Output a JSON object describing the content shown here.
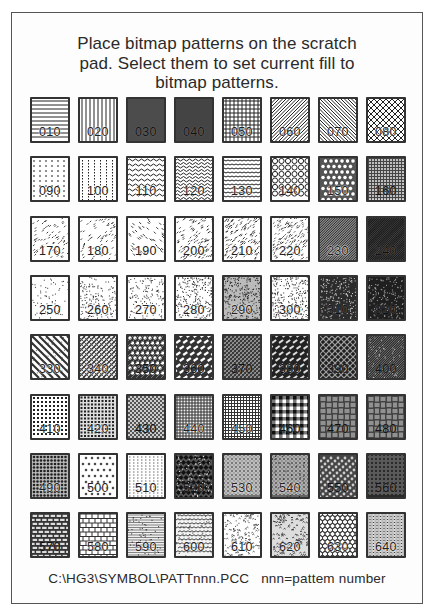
{
  "document": {
    "title_lines": [
      "Place bitmap patterns on the scratch",
      "pad.  Select them to set current fill to",
      "bitmap patterns."
    ],
    "caption": "C:\\HG3\\SYMBOL\\PATTnnn.PCC   nnn=pattem number"
  },
  "patterns": {
    "rows": [
      [
        {
          "label": "010",
          "pattern": "horizontal-lines"
        },
        {
          "label": "020",
          "pattern": "vertical-lines"
        },
        {
          "label": "030",
          "pattern": "dense-vertical-lines"
        },
        {
          "label": "040",
          "pattern": "dense-horizontal-lines"
        },
        {
          "label": "050",
          "pattern": "grid"
        },
        {
          "label": "060",
          "pattern": "diagonal-up"
        },
        {
          "label": "070",
          "pattern": "diagonal-down"
        },
        {
          "label": "080",
          "pattern": "diagonal-crosshatch"
        }
      ],
      [
        {
          "label": "090",
          "pattern": "dashes-sparse"
        },
        {
          "label": "100",
          "pattern": "dots-vertical"
        },
        {
          "label": "110",
          "pattern": "waves"
        },
        {
          "label": "120",
          "pattern": "dense-waves"
        },
        {
          "label": "130",
          "pattern": "scallops"
        },
        {
          "label": "140",
          "pattern": "circles"
        },
        {
          "label": "150",
          "pattern": "dense-circles"
        },
        {
          "label": "160",
          "pattern": "small-circles-dense"
        }
      ],
      [
        {
          "label": "170",
          "pattern": "scattered-dashes"
        },
        {
          "label": "180",
          "pattern": "scattered-dashes-2"
        },
        {
          "label": "190",
          "pattern": "diagonal-dashes-light"
        },
        {
          "label": "200",
          "pattern": "diagonal-dashes"
        },
        {
          "label": "210",
          "pattern": "diagonal-dashes-medium"
        },
        {
          "label": "220",
          "pattern": "diagonal-dashes-dense"
        },
        {
          "label": "230",
          "pattern": "diagonal-heavy"
        },
        {
          "label": "240",
          "pattern": "diagonal-heavier"
        }
      ],
      [
        {
          "label": "250",
          "pattern": "stipple-light"
        },
        {
          "label": "260",
          "pattern": "stipple-medium"
        },
        {
          "label": "270",
          "pattern": "stipple-medium-2"
        },
        {
          "label": "280",
          "pattern": "stipple-dense"
        },
        {
          "label": "290",
          "pattern": "stipple-denser"
        },
        {
          "label": "300",
          "pattern": "stipple-dense-2"
        },
        {
          "label": "310",
          "pattern": "stipple-dark"
        },
        {
          "label": "320",
          "pattern": "stipple-darker"
        }
      ],
      [
        {
          "label": "330",
          "pattern": "diagonal-bands"
        },
        {
          "label": "340",
          "pattern": "weave-light"
        },
        {
          "label": "350",
          "pattern": "lattice"
        },
        {
          "label": "360",
          "pattern": "diagonal-bricks"
        },
        {
          "label": "370",
          "pattern": "weave-dark"
        },
        {
          "label": "380",
          "pattern": "diagonal-bricks-dark"
        },
        {
          "label": "390",
          "pattern": "herringbone-dark"
        },
        {
          "label": "400",
          "pattern": "diagonal-dense-dark"
        }
      ],
      [
        {
          "label": "410",
          "pattern": "dot-grid"
        },
        {
          "label": "420",
          "pattern": "dot-grid-dense"
        },
        {
          "label": "430",
          "pattern": "checker-fine"
        },
        {
          "label": "440",
          "pattern": "square-grid-dots"
        },
        {
          "label": "450",
          "pattern": "fine-grid"
        },
        {
          "label": "460",
          "pattern": "plaid"
        },
        {
          "label": "470",
          "pattern": "basket-weave"
        },
        {
          "label": "480",
          "pattern": "basket-weave-2"
        }
      ],
      [
        {
          "label": "490",
          "pattern": "dot-grid-heavy"
        },
        {
          "label": "500",
          "pattern": "diamonds-sparse"
        },
        {
          "label": "510",
          "pattern": "dashes-fine"
        },
        {
          "label": "520",
          "pattern": "diamond-checker"
        },
        {
          "label": "530",
          "pattern": "circle-grid"
        },
        {
          "label": "540",
          "pattern": "circle-grid-2"
        },
        {
          "label": "550",
          "pattern": "diagonal-beads"
        },
        {
          "label": "560",
          "pattern": "circle-grid-dark"
        }
      ],
      [
        {
          "label": "570",
          "pattern": "bricks-dark"
        },
        {
          "label": "580",
          "pattern": "bricks"
        },
        {
          "label": "590",
          "pattern": "fine-horizontal"
        },
        {
          "label": "600",
          "pattern": "scales"
        },
        {
          "label": "610",
          "pattern": "random-marks"
        },
        {
          "label": "620",
          "pattern": "random-marks-dense"
        },
        {
          "label": "630",
          "pattern": "fish-scales"
        },
        {
          "label": "640",
          "pattern": "vertical-beads"
        }
      ]
    ]
  }
}
